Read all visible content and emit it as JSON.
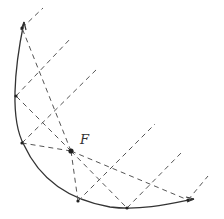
{
  "diagram": {
    "focus": {
      "label": "F",
      "x": 71,
      "y": 151
    },
    "curve_points": [
      {
        "x": 22,
        "y": 28
      },
      {
        "x": 16,
        "y": 96
      },
      {
        "x": 22,
        "y": 143
      },
      {
        "x": 78,
        "y": 201
      },
      {
        "x": 127,
        "y": 208
      },
      {
        "x": 188,
        "y": 200
      }
    ],
    "ray_ends": [
      {
        "x": 43,
        "y": 8
      },
      {
        "x": 71,
        "y": 38
      },
      {
        "x": 98,
        "y": 68
      },
      {
        "x": 155,
        "y": 124
      },
      {
        "x": 182,
        "y": 152
      },
      {
        "x": 208,
        "y": 176
      }
    ],
    "colors": {
      "curve": "#333333",
      "dashed": "#555555",
      "point": "#222222"
    }
  }
}
